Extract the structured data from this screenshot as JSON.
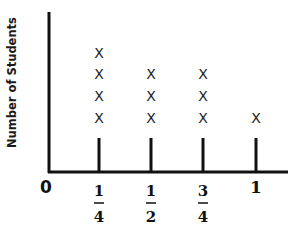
{
  "chart_data": {
    "type": "line plot (dot plot)",
    "title": "",
    "xlabel": "",
    "ylabel": "Number of Students",
    "categories": [
      "1/4",
      "1/2",
      "3/4",
      "1"
    ],
    "values": [
      4,
      3,
      3,
      1
    ],
    "marker": "X",
    "x_ticks": [
      "0",
      "1/4",
      "1/2",
      "3/4",
      "1"
    ],
    "xlim": [
      0,
      1
    ],
    "grid": false,
    "legend": null
  },
  "labels": {
    "ylabel": "Number of Students",
    "zero": "0",
    "one": "1",
    "quarter_num": "1",
    "quarter_den": "4",
    "half_num": "1",
    "half_den": "2",
    "threequarter_num": "3",
    "threequarter_den": "4",
    "marker": "X"
  },
  "colors": {
    "ink": "#111111",
    "background": "#ffffff"
  }
}
